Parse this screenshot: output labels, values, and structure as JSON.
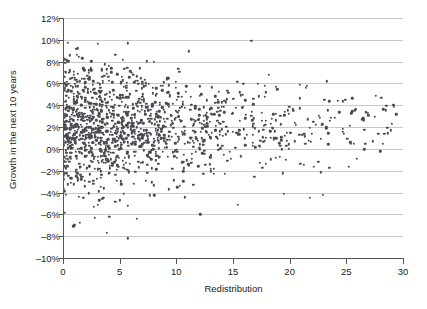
{
  "chart_data": {
    "type": "scatter",
    "title": "",
    "xlabel": "Redistribution",
    "ylabel": "Growth in the next 10 years",
    "xlim": [
      0,
      30
    ],
    "ylim": [
      -10,
      12
    ],
    "grid": true,
    "legend": null,
    "marker_color": "#4a4a52",
    "gridline_color": "#c9c9c9",
    "axis_color": "#555555",
    "background_color": "#ffffff",
    "x_ticks": [
      0,
      5,
      10,
      15,
      20,
      25,
      30
    ],
    "x_tick_labels": [
      "0",
      "5",
      "10",
      "15",
      "20",
      "25",
      "30"
    ],
    "y_ticks": [
      -10,
      -8,
      -6,
      -4,
      -2,
      0,
      2,
      4,
      6,
      8,
      10,
      12
    ],
    "y_tick_labels": [
      "–10%",
      "–8%",
      "–6%",
      "–4%",
      "–2%",
      "0%",
      "2%",
      "4%",
      "6%",
      "8%",
      "10%",
      "12%"
    ],
    "n_points": 1400,
    "point_cloud_spec": {
      "x_mode_low": 0.0,
      "x_decay": 8.5,
      "x_max": 29.6,
      "y_center": 2.1,
      "y_sd_at_x0": 3.0,
      "y_sd_at_xmax": 1.45,
      "y_clip": [
        -8.3,
        9.9
      ]
    },
    "notable_outliers": [
      {
        "x": 5.7,
        "y": -8.2
      },
      {
        "x": 0.9,
        "y": -7.1
      },
      {
        "x": 1.0,
        "y": -7.0
      },
      {
        "x": 1.5,
        "y": -6.8
      },
      {
        "x": 2.8,
        "y": -6.3
      },
      {
        "x": 6.5,
        "y": -6.4
      },
      {
        "x": 12.1,
        "y": -6.0
      },
      {
        "x": 15.4,
        "y": -5.1
      },
      {
        "x": 21.8,
        "y": -4.5
      },
      {
        "x": 22.9,
        "y": -4.2
      },
      {
        "x": 19.5,
        "y": -4.1
      },
      {
        "x": 16.6,
        "y": 9.9
      },
      {
        "x": 0.2,
        "y": 7.9
      },
      {
        "x": 29.2,
        "y": 3.9
      }
    ]
  },
  "axes": {
    "x_title": "Redistribution",
    "y_title": "Growth in the next 10 years"
  }
}
